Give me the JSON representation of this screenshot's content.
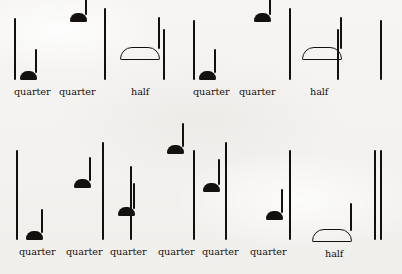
{
  "document": {
    "kind": "music-rhythm-worksheet",
    "style": "handwritten",
    "ink_color": "#14100e",
    "paper_color": "#f4f3f1"
  },
  "staves": [
    {
      "name": "stave-top",
      "barlines": [
        {
          "x": 14,
          "top": 18,
          "height": 62
        },
        {
          "x": 104,
          "top": 8,
          "height": 72
        },
        {
          "x": 163,
          "top": 29,
          "height": 51
        },
        {
          "x": 193,
          "top": 20,
          "height": 60
        },
        {
          "x": 289,
          "top": 8,
          "height": 72
        },
        {
          "x": 337,
          "top": 29,
          "height": 51
        },
        {
          "x": 380,
          "top": 20,
          "height": 60
        }
      ],
      "notes": [
        {
          "name": "note-1",
          "type": "quarter",
          "label": "quarter",
          "head": "filled",
          "x": 20,
          "head_bottom": 80,
          "stem_height": 24,
          "label_x": 14,
          "label_y": 86
        },
        {
          "name": "note-2",
          "type": "quarter",
          "label": "quarter",
          "head": "filled",
          "x": 70,
          "head_bottom": 22,
          "stem_height": 22,
          "label_x": 59,
          "label_y": 86
        },
        {
          "name": "note-3",
          "type": "half",
          "label": "half",
          "head": "open",
          "x": 120,
          "head_bottom": 60,
          "stem_height": 32,
          "label_x": 131,
          "label_y": 86
        },
        {
          "name": "note-4",
          "type": "quarter",
          "label": "quarter",
          "head": "filled",
          "x": 199,
          "head_bottom": 80,
          "stem_height": 24,
          "label_x": 193,
          "label_y": 86
        },
        {
          "name": "note-5",
          "type": "quarter",
          "label": "quarter",
          "head": "filled",
          "x": 254,
          "head_bottom": 22,
          "stem_height": 22,
          "label_x": 239,
          "label_y": 86
        },
        {
          "name": "note-6",
          "type": "half",
          "label": "half",
          "head": "open",
          "x": 302,
          "head_bottom": 60,
          "stem_height": 32,
          "label_x": 310,
          "label_y": 86
        }
      ],
      "double_barline": null
    },
    {
      "name": "stave-bottom",
      "barlines": [
        {
          "x": 16,
          "top": 22,
          "height": 90
        },
        {
          "x": 102,
          "top": 14,
          "height": 98
        },
        {
          "x": 130,
          "top": 38,
          "height": 74
        },
        {
          "x": 193,
          "top": 22,
          "height": 90
        },
        {
          "x": 225,
          "top": 14,
          "height": 98
        },
        {
          "x": 289,
          "top": 22,
          "height": 90
        }
      ],
      "notes": [
        {
          "name": "note-1",
          "type": "quarter",
          "label": "quarter",
          "head": "filled",
          "x": 26,
          "head_bottom": 112,
          "stem_height": 24,
          "label_x": 19,
          "label_y": 118
        },
        {
          "name": "note-2",
          "type": "quarter",
          "label": "quarter",
          "head": "filled",
          "x": 74,
          "head_bottom": 60,
          "stem_height": 24,
          "label_x": 66,
          "label_y": 118
        },
        {
          "name": "note-3",
          "type": "quarter",
          "label": "quarter",
          "head": "filled",
          "x": 118,
          "head_bottom": 88,
          "stem_height": 26,
          "label_x": 110,
          "label_y": 118
        },
        {
          "name": "note-4",
          "type": "quarter",
          "label": "quarter",
          "head": "filled",
          "x": 167,
          "head_bottom": 26,
          "stem_height": 24,
          "label_x": 158,
          "label_y": 118
        },
        {
          "name": "note-5",
          "type": "quarter",
          "label": "quarter",
          "head": "filled",
          "x": 203,
          "head_bottom": 64,
          "stem_height": 26,
          "label_x": 202,
          "label_y": 118
        },
        {
          "name": "note-6",
          "type": "quarter",
          "label": "quarter",
          "head": "filled",
          "x": 266,
          "head_bottom": 92,
          "stem_height": 24,
          "label_x": 250,
          "label_y": 118
        },
        {
          "name": "note-7",
          "type": "half",
          "label": "half",
          "head": "open",
          "x": 312,
          "head_bottom": 114,
          "stem_height": 28,
          "label_x": 325,
          "label_y": 120
        }
      ],
      "double_barline": {
        "x1": 374,
        "x2": 380,
        "top": 22,
        "height": 90
      }
    }
  ]
}
